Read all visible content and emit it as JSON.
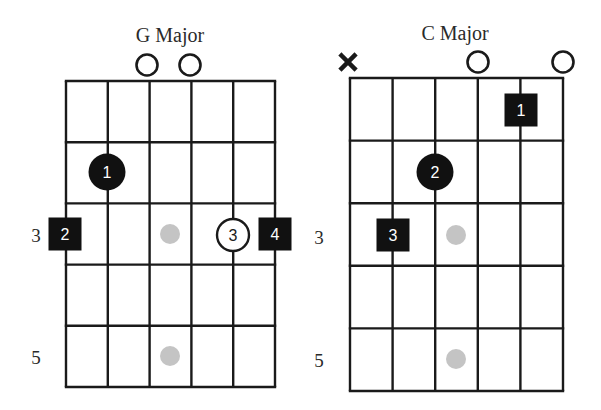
{
  "colors": {
    "ink": "#1a1a1a",
    "marker_fill": "#111111",
    "marker_text": "#ffffff",
    "open_marker_fill": "#ffffff",
    "inlay_dot": "#c4c4c4"
  },
  "charts": [
    {
      "id": "g-major",
      "title": "G Major",
      "title_pos": [
        170,
        42
      ],
      "grid": {
        "strings_x": [
          66,
          107.8,
          149.6,
          191.4,
          233.2,
          275
        ],
        "frets_y": [
          81,
          142.2,
          203.4,
          264.6,
          325.8,
          387
        ]
      },
      "fret_labels": [
        {
          "text": "3",
          "x": 36,
          "y": 242
        },
        {
          "text": "5",
          "x": 36,
          "y": 364
        }
      ],
      "string_markers_top": [
        {
          "type": "open",
          "string": 3,
          "x": 147,
          "y": 65
        },
        {
          "type": "open",
          "string": 4,
          "x": 190,
          "y": 65
        }
      ],
      "fingers": [
        {
          "label": "1",
          "shape": "circle-filled",
          "string": 2,
          "fret": 2,
          "x": 107,
          "y": 172
        },
        {
          "label": "2",
          "shape": "square-filled",
          "string": 1,
          "fret": 3,
          "x": 65,
          "y": 234
        },
        {
          "label": "3",
          "shape": "circle-open",
          "string": 5,
          "fret": 3,
          "x": 233,
          "y": 235
        },
        {
          "label": "4",
          "shape": "square-filled",
          "string": 6,
          "fret": 3,
          "x": 275,
          "y": 234
        }
      ],
      "inlays": [
        {
          "x": 170,
          "y": 234
        },
        {
          "x": 170,
          "y": 356
        }
      ]
    },
    {
      "id": "c-major",
      "title": "C Major",
      "title_pos": [
        455,
        40
      ],
      "grid": {
        "strings_x": [
          350,
          392.6,
          435.2,
          477.8,
          520.4,
          563
        ],
        "frets_y": [
          78,
          140.6,
          203.2,
          265.8,
          328.4,
          391
        ]
      },
      "fret_labels": [
        {
          "text": "3",
          "x": 319,
          "y": 244
        },
        {
          "text": "5",
          "x": 319,
          "y": 367
        }
      ],
      "string_markers_top": [
        {
          "type": "muted",
          "string": 1,
          "x": 348,
          "y": 62
        },
        {
          "type": "open",
          "string": 4,
          "x": 478,
          "y": 62
        },
        {
          "type": "open",
          "string": 6,
          "x": 563,
          "y": 62
        }
      ],
      "fingers": [
        {
          "label": "1",
          "shape": "square-filled",
          "string": 5,
          "fret": 1,
          "x": 521,
          "y": 110
        },
        {
          "label": "2",
          "shape": "circle-filled",
          "string": 3,
          "fret": 2,
          "x": 435,
          "y": 172
        },
        {
          "label": "3",
          "shape": "square-filled",
          "string": 2,
          "fret": 3,
          "x": 393,
          "y": 235
        }
      ],
      "inlays": [
        {
          "x": 456,
          "y": 235
        },
        {
          "x": 456,
          "y": 359
        }
      ]
    }
  ]
}
